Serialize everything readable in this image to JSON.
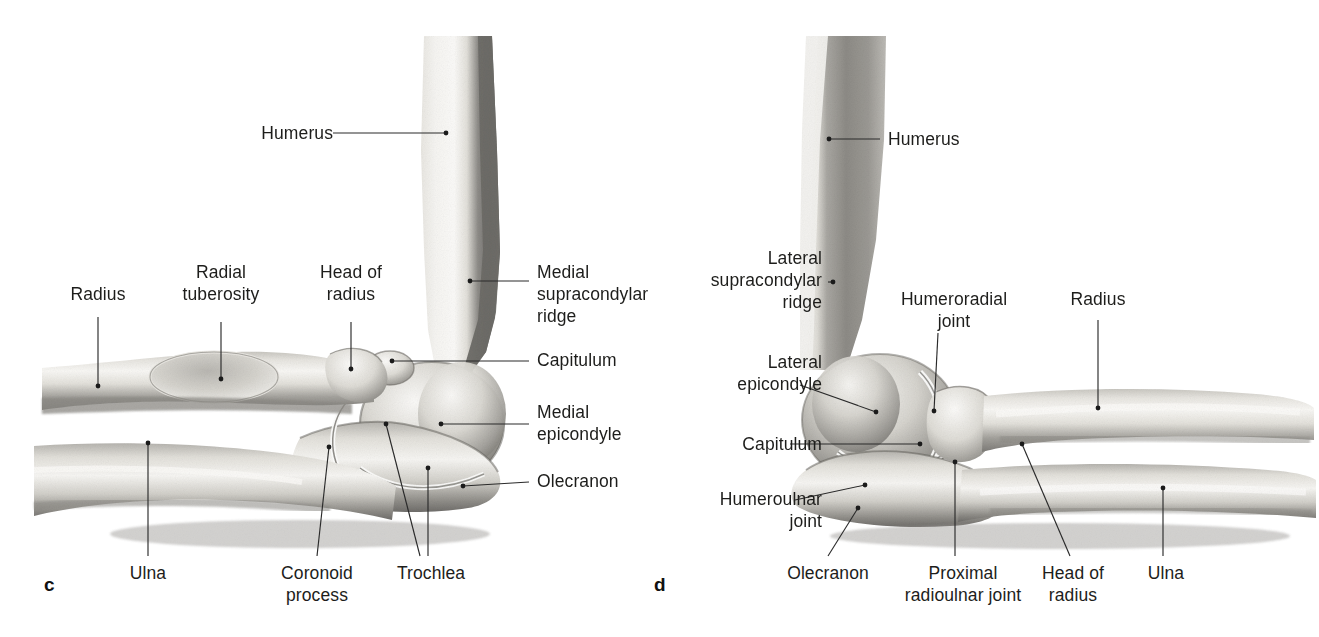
{
  "figure": {
    "background": "#ffffff",
    "ink": "#1d1d1b",
    "type": "anatomical-illustration",
    "panels": [
      {
        "letter": "c",
        "view": "medial view of right elbow",
        "labels": [
          {
            "id": "humerus",
            "text": "Humerus"
          },
          {
            "id": "radius",
            "text": "Radius"
          },
          {
            "id": "radial-tuberosity",
            "text": "Radial\ntuberosity"
          },
          {
            "id": "head-of-radius",
            "text": "Head of\nradius"
          },
          {
            "id": "medial-supracondylar-ridge",
            "text": "Medial\nsupracondylar\nridge"
          },
          {
            "id": "capitulum",
            "text": "Capitulum"
          },
          {
            "id": "medial-epicondyle",
            "text": "Medial\nepicondyle"
          },
          {
            "id": "olecranon",
            "text": "Olecranon"
          },
          {
            "id": "ulna",
            "text": "Ulna"
          },
          {
            "id": "coronoid-process",
            "text": "Coronoid\nprocess"
          },
          {
            "id": "trochlea",
            "text": "Trochlea"
          }
        ]
      },
      {
        "letter": "d",
        "view": "lateral view of right elbow",
        "labels": [
          {
            "id": "humerus",
            "text": "Humerus"
          },
          {
            "id": "lateral-supracondylar-ridge",
            "text": "Lateral\nsupracondylar\nridge"
          },
          {
            "id": "lateral-epicondyle",
            "text": "Lateral\nepicondyle"
          },
          {
            "id": "capitulum",
            "text": "Capitulum"
          },
          {
            "id": "humeroulnar-joint",
            "text": "Humeroulnar\njoint"
          },
          {
            "id": "humeroradial-joint",
            "text": "Humeroradial\njoint"
          },
          {
            "id": "radius",
            "text": "Radius"
          },
          {
            "id": "olecranon",
            "text": "Olecranon"
          },
          {
            "id": "proximal-radioulnar-joint",
            "text": "Proximal\nradioulnar joint"
          },
          {
            "id": "head-of-radius",
            "text": "Head of\nradius"
          },
          {
            "id": "ulna",
            "text": "Ulna"
          }
        ]
      }
    ]
  }
}
